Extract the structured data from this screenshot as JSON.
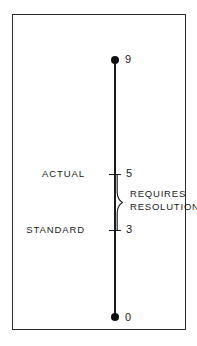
{
  "diagram": {
    "frame": {
      "border_color": "#2b2b2b",
      "background": "#ffffff"
    },
    "scale": {
      "line_color": "#1a1a1a",
      "top": {
        "value": "9",
        "marker": "filled-dot"
      },
      "bottom": {
        "value": "0",
        "marker": "filled-dot"
      }
    },
    "ticks": [
      {
        "label": "ACTUAL",
        "value": "5"
      },
      {
        "label": "STANDARD",
        "value": "3"
      }
    ],
    "annotation": {
      "line1": "REQUIRES",
      "line2": "RESOLUTION",
      "brace": "right-pointing-curly-brace"
    }
  }
}
